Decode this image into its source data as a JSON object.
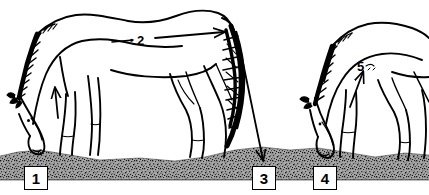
{
  "figure": {
    "background_color": "#ffffff",
    "ink_color": "#000000",
    "ground_color": "#8c8c8c",
    "width": 429,
    "height": 195
  },
  "labels": [
    {
      "id": "1",
      "text": "1",
      "style": "boxed",
      "x": 24,
      "y": 166,
      "points_to": "front-hoof-of-left-horse"
    },
    {
      "id": "2",
      "text": "2",
      "style": "plain",
      "x": 137,
      "y": 34,
      "points_to": "topline-of-left-horse-toward-tail"
    },
    {
      "id": "3",
      "text": "3",
      "style": "boxed",
      "x": 252,
      "y": 166,
      "points_to": "ground-behind-left-horse"
    },
    {
      "id": "4",
      "text": "4",
      "style": "boxed",
      "x": 313,
      "y": 166,
      "points_to": "front-hoof-of-right-horse"
    },
    {
      "id": "5",
      "text": "5",
      "style": "plain",
      "x": 357,
      "y": 60,
      "points_to": "shoulder-of-right-horse"
    }
  ],
  "arrows": [
    {
      "name": "arrow-to-1",
      "from": "label-1",
      "to": "left-horse-shoulder",
      "direction": "up"
    },
    {
      "name": "arrow-2-right",
      "from": "label-2",
      "to": "left-horse-hindquarters",
      "direction": "right"
    },
    {
      "name": "arrow-2-left",
      "from": "label-2",
      "to": "left-horse-neck",
      "direction": "left"
    },
    {
      "name": "arrow-to-3",
      "from": "left-horse-tail",
      "to": "label-3",
      "direction": "down-right"
    },
    {
      "name": "arrow-to-5",
      "from": "label-5",
      "to": "right-horse-shoulder",
      "direction": "up-left"
    }
  ],
  "subjects": [
    {
      "name": "left-horse",
      "pose": "grazing, head lowered to ground, long mane, full tail"
    },
    {
      "name": "right-horse",
      "pose": "grazing, head lowered to ground, partially shown at right edge"
    }
  ],
  "ground": {
    "name": "speckled-ground",
    "description": "stippled gray soil strip across the lower portion"
  }
}
